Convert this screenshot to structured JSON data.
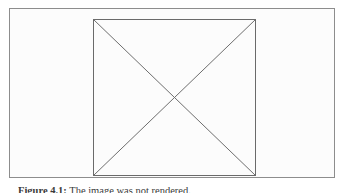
{
  "figure": {
    "frame": {
      "name": "figure-bounding-box",
      "border_color": "#8d8d8d",
      "fill_color": "#fcfcfc"
    },
    "graphic": {
      "name": "crossed-box-placeholder",
      "description": "Square outline with two diagonals forming an X",
      "stroke_color": "#6e6e6e",
      "box": {
        "x": 0,
        "y": 0,
        "width": 162,
        "height": 156
      },
      "diagonals": [
        {
          "x1": 0,
          "y1": 0,
          "x2": 162,
          "y2": 156
        },
        {
          "x1": 162,
          "y1": 0,
          "x2": 0,
          "y2": 156
        }
      ],
      "center": {
        "x": 81,
        "y": 78
      }
    }
  },
  "caption": {
    "label": "Figure 4.1:",
    "text": "The image was not rendered.",
    "full": "Figure 4.1:  The image was not rendered."
  },
  "page": {
    "background_color": "#ffffff",
    "width": 344,
    "height": 193
  }
}
